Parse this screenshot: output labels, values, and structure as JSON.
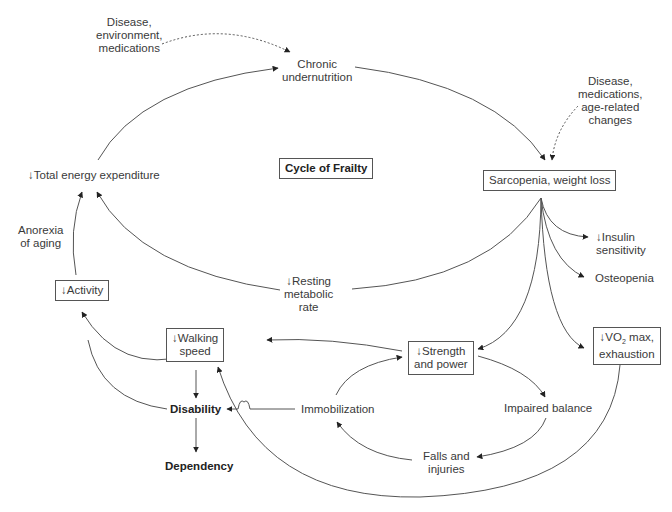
{
  "title": "Cycle of Frailty",
  "nodes": {
    "influences_top": [
      "Disease,",
      "environment,",
      "medications"
    ],
    "chronic_undernutrition": [
      "Chronic",
      "undernutrition"
    ],
    "influences_right": [
      "Disease,",
      "medications,",
      "age-related",
      "changes"
    ],
    "sarcopenia": "Sarcopenia, weight loss",
    "total_energy": "↓Total energy expenditure",
    "anorexia": [
      "Anorexia",
      "of aging"
    ],
    "activity": "↓Activity",
    "resting_metabolic": [
      "↓Resting",
      "metabolic",
      "rate"
    ],
    "insulin": [
      "↓Insulin",
      "sensitivity"
    ],
    "osteopenia": "Osteopenia",
    "walking_speed": [
      "↓Walking",
      "speed"
    ],
    "strength": [
      "↓Strength",
      "and power"
    ],
    "vo2_prefix": "↓VO",
    "vo2_sub": "2",
    "vo2_suffix": " max,",
    "vo2_line2": "exhaustion",
    "disability": "Disability",
    "dependency": "Dependency",
    "immobilization": "Immobilization",
    "impaired_balance": "Impaired balance",
    "falls": [
      "Falls and",
      "injuries"
    ]
  }
}
